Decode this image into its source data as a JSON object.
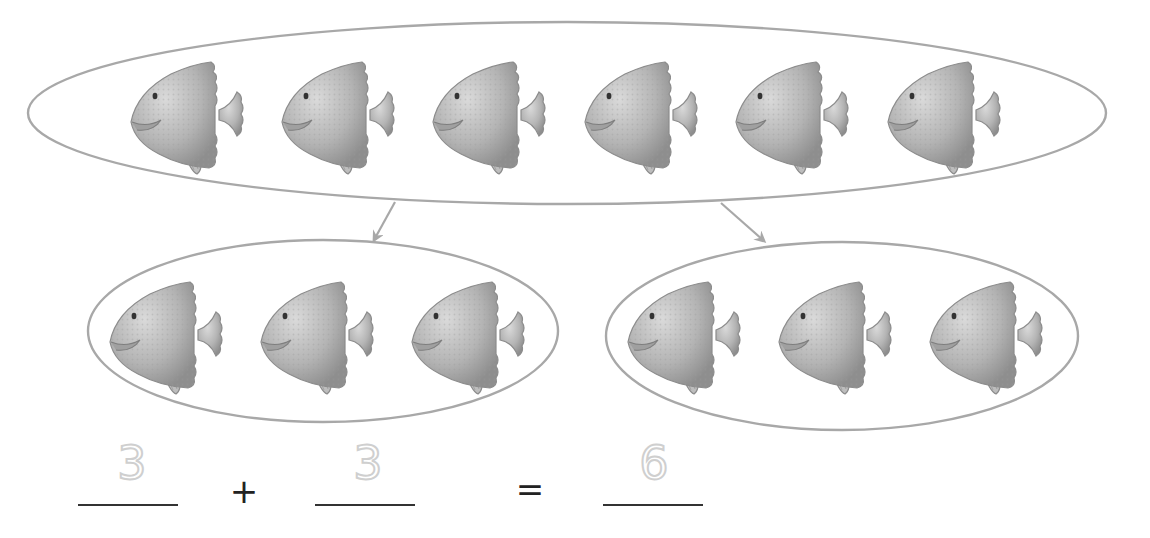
{
  "diagram": {
    "title": "",
    "total_group": {
      "count": 6,
      "item": "fish-icon"
    },
    "sub_groups": [
      {
        "count": 3,
        "item": "fish-icon"
      },
      {
        "count": 3,
        "item": "fish-icon"
      }
    ],
    "colors": {
      "outline": "#a8a8a8",
      "fish_body": "#b9b9b9",
      "fish_dark": "#8c8c8c",
      "answer_digits": "#cfcfcf",
      "text": "#222222"
    }
  },
  "equation": {
    "addend1": "3",
    "plus": "+",
    "addend2": "3",
    "equals": "=",
    "sum": "6"
  }
}
